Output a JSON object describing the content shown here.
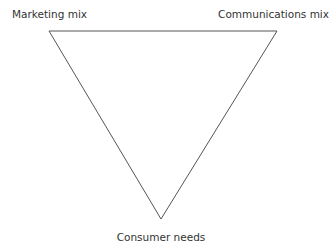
{
  "diagram": {
    "type": "inverted-triangle",
    "vertices": {
      "top_left": "Marketing mix",
      "top_right": "Communications mix",
      "bottom": "Consumer needs"
    },
    "line_color": "#555555",
    "text_color": "#333333"
  }
}
